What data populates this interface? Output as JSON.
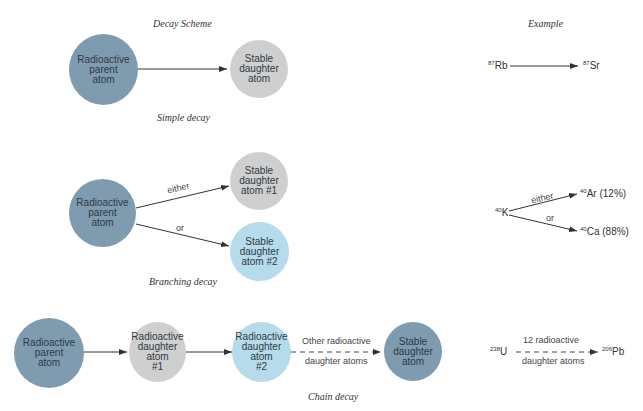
{
  "headers": {
    "scheme": "Decay Scheme",
    "example": "Example"
  },
  "simple": {
    "caption": "Simple decay",
    "parent": [
      "Radioactive",
      "parent",
      "atom"
    ],
    "daughter": [
      "Stable",
      "daughter",
      "atom"
    ],
    "example": {
      "from_mass": "87",
      "from_el": "Rb",
      "to_mass": "87",
      "to_el": "Sr"
    }
  },
  "branching": {
    "caption": "Branching decay",
    "parent": [
      "Radioactive",
      "parent",
      "atom"
    ],
    "daughter1": [
      "Stable",
      "daughter",
      "atom #1"
    ],
    "daughter2": [
      "Stable",
      "daughter",
      "atom #2"
    ],
    "label_either": "either",
    "label_or": "or",
    "example": {
      "from_mass": "40",
      "from_el": "K",
      "to1_mass": "40",
      "to1_el": "Ar (12%)",
      "to2_mass": "40",
      "to2_el": "Ca (88%)",
      "label_either": "either",
      "label_or": "or"
    }
  },
  "chain": {
    "caption": "Chain decay",
    "parent": [
      "Radioactive",
      "parent",
      "atom"
    ],
    "daughter1": [
      "Radioactive",
      "daughter",
      "atom",
      "#1"
    ],
    "daughter2": [
      "Radioactive",
      "daughter",
      "atom",
      "#2"
    ],
    "other_top": "Other radioactive",
    "other_bottom": "daughter atoms",
    "stable": [
      "Stable",
      "daughter",
      "atom"
    ],
    "example": {
      "from_mass": "238",
      "from_el": "U",
      "to_mass": "206",
      "to_el": "Pb",
      "label_top": "12 radioactive",
      "label_bottom": "daughter atoms"
    }
  },
  "colors": {
    "parent": "#7f9bb0",
    "stable": "#cfcfcf",
    "blue": "#b6dcec",
    "arrow": "#333333"
  }
}
